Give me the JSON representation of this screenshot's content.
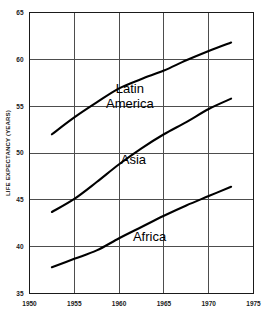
{
  "chart_data": {
    "type": "line",
    "title": "",
    "subtitle": "",
    "xlabel": "",
    "ylabel": "LIFE EXPECTANCY (YEARS)",
    "xlim": [
      1950,
      1975
    ],
    "ylim": [
      35,
      65
    ],
    "grid": true,
    "legend_position": "inline-annotations",
    "x_ticks": [
      "1950",
      "1955",
      "1960",
      "1965",
      "1970",
      "1975"
    ],
    "y_ticks": [
      "35",
      "40",
      "45",
      "50",
      "55",
      "60",
      "65"
    ],
    "x_tick_values": [
      1950,
      1955,
      1960,
      1965,
      1970,
      1975
    ],
    "y_tick_values": [
      35,
      40,
      45,
      50,
      55,
      60,
      65
    ],
    "annotations": [
      {
        "text": "Latin",
        "x": 1961.2,
        "y": 56.4
      },
      {
        "text": "America",
        "x": 1961.2,
        "y": 54.8
      },
      {
        "text": "Asia",
        "x": 1961.6,
        "y": 48.8
      },
      {
        "text": "Africa",
        "x": 1963.4,
        "y": 40.6
      }
    ],
    "series": [
      {
        "name": "Latin America",
        "color": "#000000",
        "x": [
          1952.5,
          1955.0,
          1957.5,
          1960.0,
          1962.5,
          1965.0,
          1967.5,
          1970.0,
          1972.5
        ],
        "values": [
          52.0,
          53.8,
          55.4,
          56.9,
          57.9,
          58.8,
          59.9,
          60.9,
          61.8
        ]
      },
      {
        "name": "Asia",
        "color": "#000000",
        "x": [
          1952.5,
          1955.0,
          1957.5,
          1960.0,
          1962.5,
          1965.0,
          1967.5,
          1970.0,
          1972.5
        ],
        "values": [
          43.7,
          45.1,
          46.9,
          48.8,
          50.5,
          52.0,
          53.3,
          54.7,
          55.8
        ]
      },
      {
        "name": "Africa",
        "color": "#000000",
        "x": [
          1952.5,
          1955.0,
          1957.5,
          1960.0,
          1962.5,
          1965.0,
          1967.5,
          1970.0,
          1972.5
        ],
        "values": [
          37.8,
          38.7,
          39.6,
          40.9,
          42.1,
          43.3,
          44.4,
          45.4,
          46.4
        ]
      }
    ]
  }
}
